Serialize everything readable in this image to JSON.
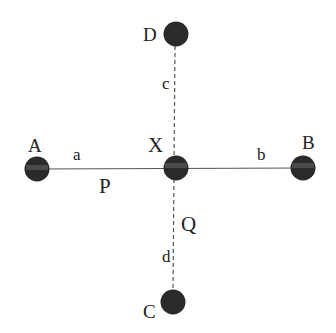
{
  "diagram": {
    "nodes": {
      "A": {
        "label": "A",
        "cx": 37,
        "cy": 168
      },
      "B": {
        "label": "B",
        "cx": 303,
        "cy": 167
      },
      "C": {
        "label": "C",
        "cx": 173,
        "cy": 302
      },
      "D": {
        "label": "D",
        "cx": 175,
        "cy": 34
      },
      "X": {
        "label": "X",
        "cx": 176,
        "cy": 168
      }
    },
    "segments": {
      "a": "a",
      "b": "b",
      "c": "c",
      "d": "d"
    },
    "points": {
      "P": "P",
      "Q": "Q"
    },
    "colors": {
      "node_fill": "#2a2a2a",
      "node_band": "#555555",
      "line": "#444444"
    }
  }
}
